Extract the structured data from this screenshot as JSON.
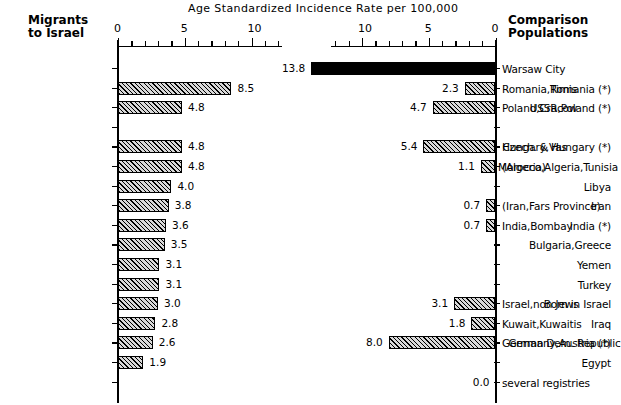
{
  "chart_title": "Age Standardized Incidence Rate per 100,000",
  "left_header": "Migrants\nto Israel",
  "left_header_line1": "Migrants",
  "left_header_line2": "to Israel",
  "right_header_line1": "Comparison",
  "right_header_line2": "Populations",
  "axis": {
    "left_ticks": [
      "0",
      "5",
      "10"
    ],
    "right_ticks": [
      "10",
      "5",
      "0"
    ],
    "max": 14,
    "units_per_tick": 1
  },
  "chart_data": {
    "type": "bar",
    "orientation": "horizontal-paired",
    "title": "Age Standardized Incidence Rate per 100,000",
    "xlabel": "Age Standardized Incidence Rate per 100,000",
    "ylabel": "",
    "xlim": [
      0,
      14
    ],
    "grid": false,
    "legend": "",
    "left_axis_label": "Migrants to Israel",
    "right_axis_label": "Comparison Populations",
    "left_tick_labels": [
      "0",
      "5",
      "10"
    ],
    "right_tick_labels": [
      "10",
      "5",
      "0"
    ],
    "rows": [
      {
        "index": 0,
        "left_label": "",
        "left_value": null,
        "left_value_text": "",
        "right_label": "Warsaw City",
        "right_value": 13.8,
        "right_value_text": "13.8",
        "right_fill": "solid"
      },
      {
        "index": 1,
        "left_label": "Romania (*)",
        "left_value": 8.5,
        "left_value_text": "8.5",
        "right_label": "Romania,Timis",
        "right_value": 2.3,
        "right_value_text": "2.3",
        "right_fill": "hatch"
      },
      {
        "index": 2,
        "left_label": "USSR,Poland (*)",
        "left_value": 4.8,
        "left_value_text": "4.8",
        "right_label": "Poland,Cracow",
        "right_value": 4.7,
        "right_value_text": "4.7",
        "right_fill": "hatch"
      },
      {
        "index": 3,
        "left_label": "",
        "left_value": null,
        "left_value_text": "",
        "right_label": "",
        "right_value": null,
        "right_value_text": "",
        "right_fill": "none"
      },
      {
        "index": 4,
        "left_label": "Czech. & Hungary (*)",
        "left_value": 4.8,
        "left_value_text": "4.8",
        "right_label": "Hungary,Vas",
        "right_value": 5.4,
        "right_value_text": "5.4",
        "right_fill": "hatch"
      },
      {
        "index": 5,
        "left_label": "Morocco,Algeria,Tunisia",
        "left_value": 4.8,
        "left_value_text": "4.8",
        "right_label": "(Algeria)",
        "right_value": 1.1,
        "right_value_text": "1.1",
        "right_fill": "hatch"
      },
      {
        "index": 6,
        "left_label": "Libya",
        "left_value": 4.0,
        "left_value_text": "4.0",
        "right_label": "",
        "right_value": null,
        "right_value_text": "",
        "right_fill": "none"
      },
      {
        "index": 7,
        "left_label": "Iran",
        "left_value": 3.8,
        "left_value_text": "3.8",
        "right_label": "(Iran,Fars Province)",
        "right_value": 0.7,
        "right_value_text": "0.7",
        "right_fill": "hatch"
      },
      {
        "index": 8,
        "left_label": "India (*)",
        "left_value": 3.6,
        "left_value_text": "3.6",
        "right_label": "India,Bombay",
        "right_value": 0.7,
        "right_value_text": "0.7",
        "right_fill": "hatch"
      },
      {
        "index": 9,
        "left_label": "Bulgaria,Greece",
        "left_value": 3.5,
        "left_value_text": "3.5",
        "right_label": "",
        "right_value": null,
        "right_value_text": "",
        "right_fill": "none"
      },
      {
        "index": 10,
        "left_label": "Yemen",
        "left_value": 3.1,
        "left_value_text": "3.1",
        "right_label": "",
        "right_value": null,
        "right_value_text": "",
        "right_fill": "none"
      },
      {
        "index": 11,
        "left_label": "Turkey",
        "left_value": 3.1,
        "left_value_text": "3.1",
        "right_label": "",
        "right_value": null,
        "right_value_text": "",
        "right_fill": "none"
      },
      {
        "index": 12,
        "left_label": "Born in Israel",
        "left_value": 3.0,
        "left_value_text": "3.0",
        "right_label": "Israel,non Jews",
        "right_value": 3.1,
        "right_value_text": "3.1",
        "right_fill": "hatch"
      },
      {
        "index": 13,
        "left_label": "Iraq",
        "left_value": 2.8,
        "left_value_text": "2.8",
        "right_label": "Kuwait,Kuwaitis",
        "right_value": 1.8,
        "right_value_text": "1.8",
        "right_fill": "hatch"
      },
      {
        "index": 14,
        "left_label": "Germany,Austria (*)",
        "left_value": 2.6,
        "left_value_text": "2.6",
        "right_label": "German Dem. Republic",
        "right_value": 8.0,
        "right_value_text": "8.0",
        "right_fill": "hatch"
      },
      {
        "index": 15,
        "left_label": "Egypt",
        "left_value": 1.9,
        "left_value_text": "1.9",
        "right_label": "",
        "right_value": null,
        "right_value_text": "",
        "right_fill": "none"
      },
      {
        "index": 16,
        "left_label": "",
        "left_value": null,
        "left_value_text": "",
        "right_label": "several registries",
        "right_value": 0.0,
        "right_value_text": "0.0",
        "right_fill": "none"
      }
    ]
  }
}
